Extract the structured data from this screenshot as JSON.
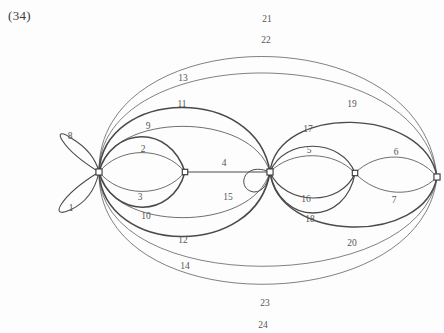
{
  "figure": {
    "number": "(34)",
    "type": "multigraph-diagram",
    "width": 444,
    "height": 333,
    "background": "#fdfdfd",
    "stroke_color": "#4a4a4a",
    "vertex_fill": "#ffffff",
    "vertex_stroke": "#333333"
  },
  "vertices": [
    {
      "id": "v1",
      "label": "",
      "x": 99,
      "y": 172,
      "r": 3.6
    },
    {
      "id": "v2",
      "label": "",
      "x": 185,
      "y": 172,
      "r": 3.2
    },
    {
      "id": "v3",
      "label": "",
      "x": 270,
      "y": 172,
      "r": 3.6
    },
    {
      "id": "v4",
      "label": "",
      "x": 355,
      "y": 173,
      "r": 3.2
    },
    {
      "id": "v5",
      "label": "",
      "x": 437,
      "y": 177,
      "r": 3.6
    }
  ],
  "edges": [
    {
      "id": 1,
      "label": "1",
      "kind": "loop",
      "from": "v1",
      "to": "v1",
      "path": "M 99 172 C 60 196, 48 220, 70 210 C 88 202, 96 186, 99 172 Z",
      "width": 1.1,
      "label_x": 71,
      "label_y": 208
    },
    {
      "id": 2,
      "label": "2",
      "kind": "arc",
      "from": "v1",
      "to": "v2",
      "path": "M 99 172 C 120 146, 164 146, 185 172",
      "width": 0.8,
      "label_x": 143,
      "label_y": 149
    },
    {
      "id": 3,
      "label": "3",
      "kind": "arc",
      "from": "v1",
      "to": "v2",
      "path": "M 99 172 C 120 198, 164 198, 185 172",
      "width": 0.8,
      "label_x": 140,
      "label_y": 197
    },
    {
      "id": 4,
      "label": "4",
      "kind": "line",
      "from": "v2",
      "to": "v3",
      "path": "M 185 172 L 270 172",
      "width": 1.0,
      "label_x": 224,
      "label_y": 163
    },
    {
      "id": 5,
      "label": "5",
      "kind": "arc",
      "from": "v3",
      "to": "v4",
      "path": "M 270 172 C 291 150, 334 150, 355 173",
      "width": 0.8,
      "label_x": 309,
      "label_y": 150
    },
    {
      "id": 6,
      "label": "6",
      "kind": "arc",
      "from": "v4",
      "to": "v5",
      "path": "M 355 173 C 377 151, 416 151, 437 177",
      "width": 0.8,
      "label_x": 396,
      "label_y": 152
    },
    {
      "id": 7,
      "label": "7",
      "kind": "arc",
      "from": "v4",
      "to": "v5",
      "path": "M 355 173 C 377 197, 416 199, 437 177",
      "width": 0.8,
      "label_x": 394,
      "label_y": 200
    },
    {
      "id": 8,
      "label": "8",
      "kind": "loop",
      "from": "v1",
      "to": "v1",
      "path": "M 99 172 C 60 148, 50 124, 71 138 C 88 148, 96 160, 99 172 Z",
      "width": 1.1,
      "label_x": 70,
      "label_y": 136
    },
    {
      "id": 9,
      "label": "9",
      "kind": "arc",
      "from": "v1",
      "to": "v2",
      "path": "M 99 172 C 112 126, 170 124, 185 172",
      "width": 1.5,
      "label_x": 148,
      "label_y": 126
    },
    {
      "id": 10,
      "label": "10",
      "kind": "arc",
      "from": "v1",
      "to": "v2",
      "path": "M 99 172 C 112 218, 172 220, 185 172",
      "width": 1.5,
      "label_x": 146,
      "label_y": 216
    },
    {
      "id": 11,
      "label": "11",
      "kind": "arc",
      "from": "v1",
      "to": "v3",
      "path": "M 99 172 C 110 112, 252 110, 270 172",
      "width": 0.8,
      "label_x": 182,
      "label_y": 104
    },
    {
      "id": 12,
      "label": "12",
      "kind": "arc",
      "from": "v1",
      "to": "v3",
      "path": "M 99 172 C 110 232, 252 234, 270 172",
      "width": 0.8,
      "label_x": 183,
      "label_y": 240
    },
    {
      "id": 13,
      "label": "13",
      "kind": "arc",
      "from": "v1",
      "to": "v3",
      "path": "M 99 172 C 104 88, 256 84, 270 172",
      "width": 1.6,
      "label_x": 183,
      "label_y": 78
    },
    {
      "id": 14,
      "label": "14",
      "kind": "arc",
      "from": "v1",
      "to": "v3",
      "path": "M 99 172 C 104 256, 256 260, 270 172",
      "width": 1.6,
      "label_x": 185,
      "label_y": 266
    },
    {
      "id": 15,
      "label": "15",
      "kind": "loop",
      "from": "v3",
      "to": "v3",
      "path": "M 270 172 C 242 160, 236 190, 254 192 C 264 192, 268 182, 270 172 Z",
      "width": 1.0,
      "label_x": 228,
      "label_y": 197
    },
    {
      "id": 16,
      "label": "16",
      "kind": "arc",
      "from": "v3",
      "to": "v4",
      "path": "M 270 172 C 285 207, 342 206, 355 173",
      "width": 1.2,
      "label_x": 306,
      "label_y": 199
    },
    {
      "id": 17,
      "label": "17",
      "kind": "arc",
      "from": "v3",
      "to": "v4",
      "path": "M 270 172 C 284 137, 342 138, 355 173",
      "width": 1.2,
      "label_x": 308,
      "label_y": 129
    },
    {
      "id": 18,
      "label": "18",
      "kind": "arc",
      "from": "v3",
      "to": "v4",
      "path": "M 270 172 C 280 227, 346 226, 355 173",
      "width": 1.3,
      "label_x": 310,
      "label_y": 219
    },
    {
      "id": 19,
      "label": "19",
      "kind": "arc",
      "from": "v3",
      "to": "v5",
      "path": "M 270 172 C 278 104, 424 106, 437 177",
      "width": 1.4,
      "label_x": 352,
      "label_y": 104
    },
    {
      "id": 20,
      "label": "20",
      "kind": "arc",
      "from": "v3",
      "to": "v5",
      "path": "M 270 172 C 278 243, 424 246, 437 177",
      "width": 1.4,
      "label_x": 352,
      "label_y": 243
    },
    {
      "id": 21,
      "label": "21",
      "kind": "arc",
      "from": "v1",
      "to": "v5",
      "path": "M 99 172 C 96 20, 422 14, 437 177",
      "width": 0.7,
      "label_x": 267,
      "label_y": 19
    },
    {
      "id": 22,
      "label": "22",
      "kind": "arc",
      "from": "v1",
      "to": "v5",
      "path": "M 99 172 C 98 42, 420 36, 437 177",
      "width": 0.7,
      "label_x": 266,
      "label_y": 40
    },
    {
      "id": 23,
      "label": "23",
      "kind": "arc",
      "from": "v1",
      "to": "v5",
      "path": "M 99 172 C 98 298, 420 296, 437 177",
      "width": 0.7,
      "label_x": 265,
      "label_y": 303
    },
    {
      "id": 24,
      "label": "24",
      "kind": "arc",
      "from": "v1",
      "to": "v5",
      "path": "M 99 172 C 96 322, 422 320, 437 177",
      "width": 0.7,
      "label_x": 263,
      "label_y": 325
    }
  ]
}
